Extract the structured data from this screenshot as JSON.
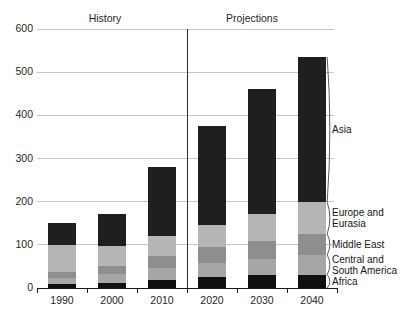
{
  "chart_data": {
    "type": "bar",
    "stacked": true,
    "title": "",
    "xlabel": "",
    "ylabel": "",
    "ylim": [
      0,
      600
    ],
    "yticks": [
      0,
      100,
      200,
      300,
      400,
      500,
      600
    ],
    "grid": "horizontal",
    "legend_position": "right-inline-region-labels",
    "categories": [
      "1990",
      "2000",
      "2010",
      "2020",
      "2030",
      "2040"
    ],
    "section_labels": {
      "history": "History",
      "projections": "Projections"
    },
    "history_categories": [
      "1990",
      "2000",
      "2010"
    ],
    "projection_categories": [
      "2020",
      "2030",
      "2040"
    ],
    "series": [
      {
        "name": "Africa",
        "color": "#101010",
        "values": [
          9,
          12,
          19,
          25,
          29,
          31
        ]
      },
      {
        "name": "Central and South America",
        "color": "#a6a6a6",
        "values": [
          14,
          21,
          28,
          34,
          39,
          46
        ]
      },
      {
        "name": "Middle East",
        "color": "#8e8e8e",
        "values": [
          13,
          19,
          26,
          36,
          42,
          48
        ]
      },
      {
        "name": "Europe and Eurasia",
        "color": "#b5b5b5",
        "values": [
          63,
          46,
          48,
          52,
          62,
          74
        ]
      },
      {
        "name": "Asia",
        "color": "#1f1f1f",
        "values": [
          51,
          74,
          160,
          228,
          288,
          336
        ]
      }
    ],
    "totals": [
      150,
      172,
      281,
      375,
      460,
      535
    ],
    "colors": {
      "gridline": "#c7c7c7",
      "axis": "#1a1a1a",
      "divider": "#2a2a2a",
      "bracket": "#4a4a4a",
      "text": "#1a1a1a",
      "background": "#ffffff"
    }
  }
}
